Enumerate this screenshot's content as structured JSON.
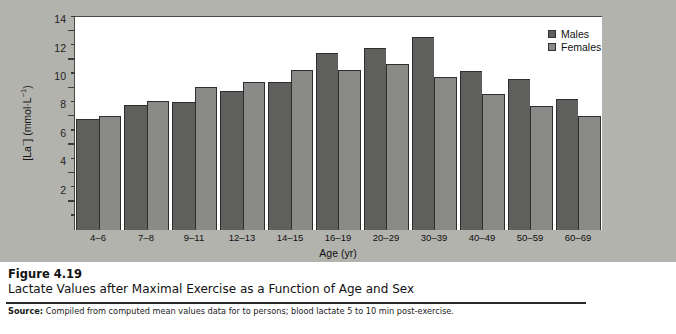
{
  "figure": {
    "number_label": "Figure 4.19",
    "title": "Lactate Values after Maximal Exercise as a Function of Age and Sex",
    "source_prefix": "Source:",
    "source_text": " Compiled from computed mean values data for   to     persons; blood lactate 5 to 10 min post-exercise."
  },
  "legend": {
    "position": "top-right",
    "entries": [
      {
        "label": "Males",
        "color": "#5f5f5d"
      },
      {
        "label": "Females",
        "color": "#8a8a88"
      }
    ]
  },
  "axes": {
    "y_title_pre": "[La",
    "y_title_sup1": "−",
    "y_title_mid": "] (mmol·L",
    "y_title_sup2": "−1",
    "y_title_post": ")",
    "x_title": "Age (yr)",
    "y_major_ticks": [
      2,
      4,
      6,
      8,
      10,
      12,
      14
    ],
    "y_minor_ticks": [
      1,
      3,
      5,
      7,
      9,
      11,
      13,
      15
    ]
  },
  "icons": {
    "runner": "runner-stairs-icon"
  },
  "chart_data": {
    "type": "bar",
    "title": "Lactate Values after Maximal Exercise as a Function of Age and Sex",
    "xlabel": "Age (yr)",
    "ylabel": "[La−] (mmol·L−1)",
    "ylim": [
      0,
      15
    ],
    "grid": false,
    "legend_position": "top-right",
    "categories": [
      "4–6",
      "7–8",
      "9–11",
      "12–13",
      "14–15",
      "16–19",
      "20–29",
      "30–39",
      "40–49",
      "50–59",
      "60–69"
    ],
    "series": [
      {
        "name": "Males",
        "values": [
          7.8,
          8.8,
          9.0,
          9.8,
          10.4,
          12.5,
          12.8,
          13.6,
          11.2,
          10.6,
          9.2
        ]
      },
      {
        "name": "Females",
        "values": [
          8.0,
          9.1,
          10.1,
          10.4,
          11.3,
          11.3,
          11.7,
          10.8,
          9.6,
          8.7,
          8.0
        ]
      }
    ]
  }
}
